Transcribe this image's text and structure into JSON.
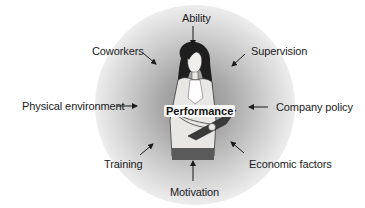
{
  "diagram": {
    "center_label": "Performance",
    "center_figure": "woman-holding-clipboard",
    "factors": [
      {
        "id": "ability",
        "label": "Ability",
        "position": "top"
      },
      {
        "id": "supervision",
        "label": "Supervision",
        "position": "top-right"
      },
      {
        "id": "company-policy",
        "label": "Company policy",
        "position": "right"
      },
      {
        "id": "economic-factors",
        "label": "Economic factors",
        "position": "bottom-right"
      },
      {
        "id": "motivation",
        "label": "Motivation",
        "position": "bottom"
      },
      {
        "id": "training",
        "label": "Training",
        "position": "bottom-left"
      },
      {
        "id": "physical-environment",
        "label": "Physical environment",
        "position": "left"
      },
      {
        "id": "coworkers",
        "label": "Coworkers",
        "position": "top-left"
      }
    ],
    "arrow_direction": "inward",
    "colors": {
      "halo_center": "#8f8f8f",
      "text": "#1b1b1b",
      "skirt": "#5a5a5a"
    }
  }
}
